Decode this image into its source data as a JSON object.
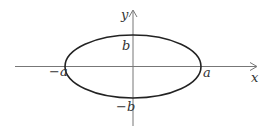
{
  "diagram": {
    "type": "ellipse-on-axes",
    "colors": {
      "axis": "#777777",
      "curve": "#222222",
      "text": "#333333"
    },
    "axes": {
      "x_label": "x",
      "y_label": "y"
    },
    "ellipse": {
      "cx": 133,
      "cy": 66.5,
      "rx": 68,
      "ry": 31.5
    },
    "labels": {
      "pos_a": "a",
      "neg_a": "−a",
      "pos_b": "b",
      "neg_b": "−b"
    }
  }
}
